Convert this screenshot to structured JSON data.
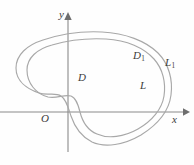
{
  "figure": {
    "type": "math-diagram",
    "background_color": "#fefefe",
    "curve_color": "#a8a8a8",
    "axis_color": "#8a8a8a",
    "label_color": "#3b3b3b",
    "axes": {
      "x_axis_label": "x",
      "y_axis_label": "y",
      "origin_label": "O",
      "x_axis_y_px": 112,
      "y_axis_x_px": 68,
      "x_axis_start_px": 0,
      "x_axis_end_px": 188,
      "y_axis_start_px": 152,
      "y_axis_end_px": 14
    },
    "labels": [
      {
        "id": "region-D",
        "text": "D",
        "subscript": "",
        "x": 78,
        "y": 72,
        "meaning": "inner region bounded by curve L"
      },
      {
        "id": "region-D1",
        "text": "D",
        "subscript": "1",
        "x": 133,
        "y": 50,
        "meaning": "outer region bounded by curve L1"
      },
      {
        "id": "curve-L",
        "text": "L",
        "subscript": "",
        "x": 140,
        "y": 80,
        "meaning": "inner closed curve"
      },
      {
        "id": "curve-L1",
        "text": "L",
        "subscript": "1",
        "x": 165,
        "y": 57,
        "meaning": "outer closed curve"
      }
    ],
    "curves": [
      {
        "id": "outer-curve",
        "name": "L1",
        "stroke": "#a8a8a8",
        "path": "M 16 68 C 16 56 26 46 42 41 C 60 35 82 32 101 33 C 124 34 145 41 157 53 C 168 64 172 80 170 95 C 168 110 157 124 141 134 C 125 144 106 147 93 142 C 80 137 74 126 71 117 C 68 108 67 100 62 97 C 56 93 48 97 40 94 C 28 90 16 81 16 68 Z"
      },
      {
        "id": "inner-curve",
        "name": "L",
        "stroke": "#a8a8a8",
        "path": "M 26 70 C 26 59 36 50 51 46 C 68 41 88 39 105 40 C 126 41 143 48 153 59 C 162 69 165 83 163 96 C 161 109 151 120 137 128 C 123 136 108 138 97 134 C 87 130 82 121 80 113 C 78 105 76 99 71 97 C 65 95 58 100 49 98 C 37 95 26 83 26 70 Z"
      }
    ]
  }
}
